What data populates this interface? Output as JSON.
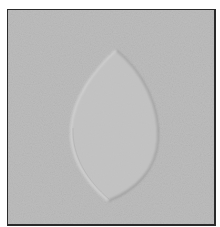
{
  "image": {
    "subject": "embossed-leaf-shape-on-paper",
    "description": "Grayscale photo of a raised pointed-oval (leaf/vesica) shape embossed on textured paper, framed by a thin dark border",
    "colors": {
      "paper": "#bdbdbd",
      "paper_dark": "#b0b0b0",
      "leaf_fill": "#c5c5c5",
      "highlight": "#dcdcdc",
      "shadow": "#8e8e8e",
      "border": "#2a2a2a"
    }
  }
}
